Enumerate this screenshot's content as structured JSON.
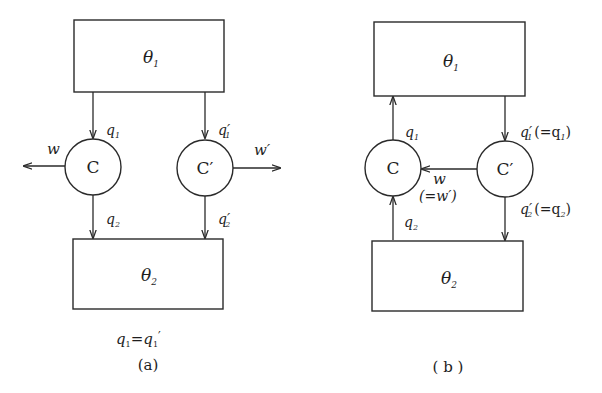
{
  "figure": {
    "panel_a": {
      "caption": "(a)",
      "relation": {
        "lhs": "q",
        "lhs_sub": "1",
        "eq": "=",
        "rhs": "q",
        "rhs_sub": "1",
        "rhs_prime": "′"
      },
      "top_reservoir": {
        "symbol": "θ",
        "sub": "1"
      },
      "bottom_reservoir": {
        "symbol": "θ",
        "sub": "2"
      },
      "engine_left": {
        "label": "C"
      },
      "engine_right": {
        "label": "C′"
      },
      "labels": {
        "q1": {
          "sym": "q",
          "sub": "1"
        },
        "q2": {
          "sym": "q",
          "sub": "2"
        },
        "q1p": {
          "sym": "q′",
          "sub": "1"
        },
        "q2p": {
          "sym": "q′",
          "sub": "2"
        },
        "w": "w",
        "wp": "w′"
      }
    },
    "panel_b": {
      "caption": "( b )",
      "top_reservoir": {
        "symbol": "θ",
        "sub": "1"
      },
      "bottom_reservoir": {
        "symbol": "θ",
        "sub": "2"
      },
      "engine_left": {
        "label": "C"
      },
      "engine_right": {
        "label": "C′"
      },
      "labels": {
        "q1": {
          "sym": "q",
          "sub": "1"
        },
        "q2": {
          "sym": "q",
          "sub": "2"
        },
        "q1p": {
          "sym": "q′",
          "sub": "1",
          "note": "(=q",
          "note_sub": "1",
          "note_end": ")"
        },
        "q2p": {
          "sym": "q′",
          "sub": "2",
          "note": "(=q",
          "note_sub": "2",
          "note_end": ")"
        },
        "w": "w",
        "w_note": "(=w′)"
      }
    }
  }
}
